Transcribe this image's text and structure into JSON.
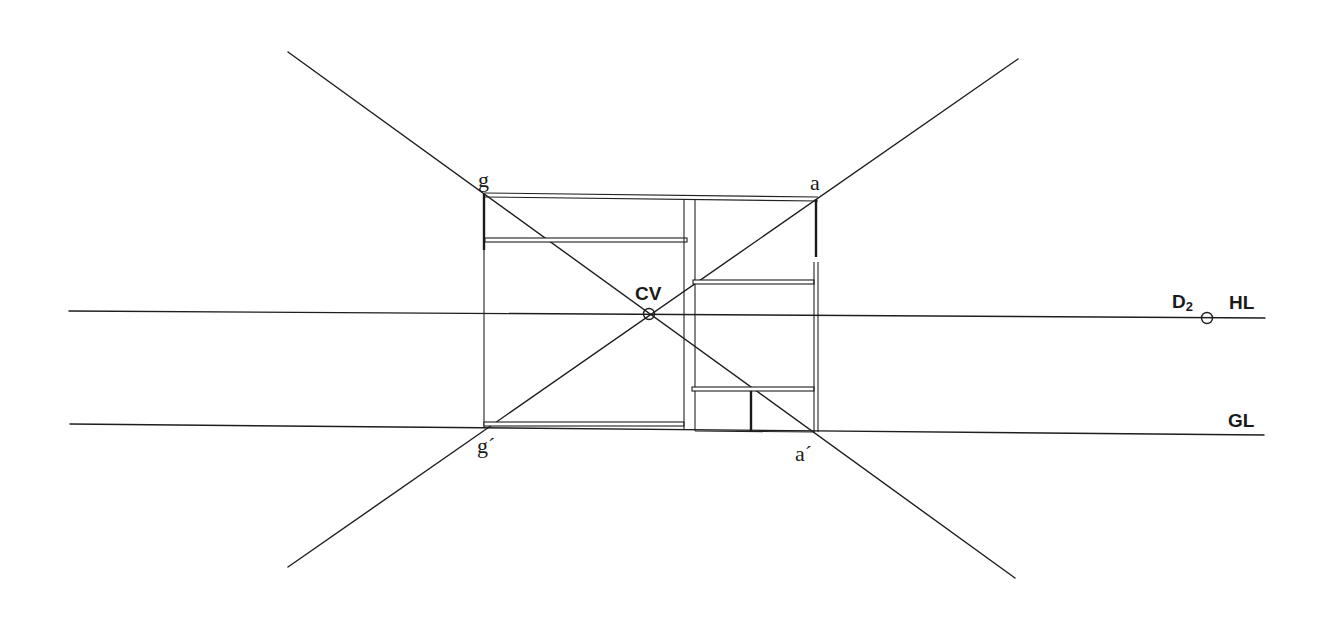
{
  "diagram": {
    "type": "one-point perspective construction",
    "labels": {
      "station_point": "CV",
      "distance_point": "D",
      "distance_point_subscript": "2",
      "horizon_line": "HL",
      "ground_line": "GL",
      "corner_top_left": "g",
      "corner_top_right": "a",
      "corner_bottom_left": "g´",
      "corner_bottom_right": "a´"
    },
    "colors": {
      "line": "#1e1e1e",
      "background": "#ffffff"
    }
  }
}
